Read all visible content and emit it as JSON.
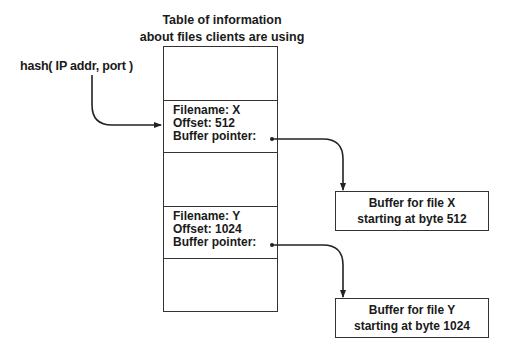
{
  "title": {
    "line1": "Table of information",
    "line2": "about files clients are using"
  },
  "hash_label": "hash( IP addr, port )",
  "table": {
    "rows": [
      {
        "type": "empty"
      },
      {
        "type": "entry",
        "filename": "Filename: X",
        "offset": "Offset: 512",
        "pointer": "Buffer pointer:"
      },
      {
        "type": "empty"
      },
      {
        "type": "entry",
        "filename": "Filename: Y",
        "offset": "Offset: 1024",
        "pointer": "Buffer pointer:"
      },
      {
        "type": "empty"
      }
    ]
  },
  "buffers": [
    {
      "line1": "Buffer for file X",
      "line2": "starting at byte 512"
    },
    {
      "line1": "Buffer for file Y",
      "line2": "starting at byte 1024"
    }
  ],
  "colors": {
    "stroke": "#333333",
    "text": "#1a1a1a",
    "background": "#ffffff"
  }
}
